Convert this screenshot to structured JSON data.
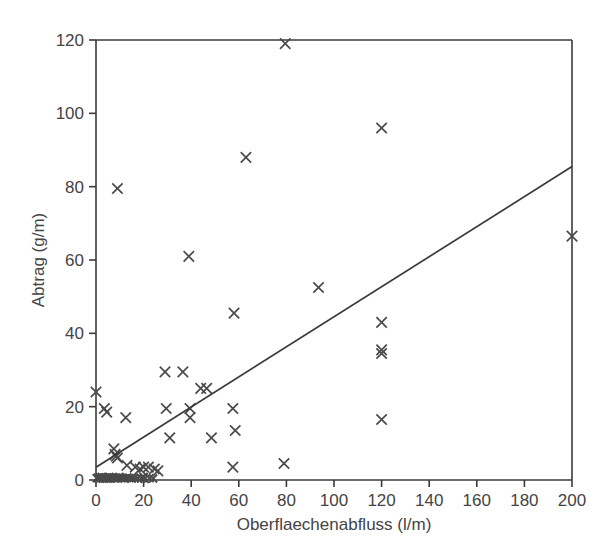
{
  "chart_data": {
    "type": "scatter",
    "title": "",
    "subtitle": "",
    "xlabel": "Oberflaechenabfluss (l/m)",
    "ylabel": "Abtrag (g/m)",
    "xlim": [
      0,
      200
    ],
    "ylim": [
      0,
      120
    ],
    "xticks": [
      0,
      20,
      40,
      60,
      80,
      100,
      120,
      140,
      160,
      180,
      200
    ],
    "yticks": [
      0,
      20,
      40,
      60,
      80,
      100,
      120
    ],
    "xtick_labels": [
      "0",
      "20",
      "40",
      "60",
      "80",
      "100",
      "120",
      "140",
      "160",
      "180",
      "200"
    ],
    "ytick_labels": [
      "0",
      "20",
      "40",
      "60",
      "80",
      "100",
      "120"
    ],
    "grid": false,
    "legend": false,
    "marker": "x",
    "marker_color": "#4a4a4a",
    "axis_color": "#3a3a3a",
    "background": "#ffffff",
    "series": [
      {
        "name": "Messpunkte",
        "marker": "x",
        "points": [
          [
            79.5,
            119.0
          ],
          [
            120.0,
            96.0
          ],
          [
            63.0,
            88.0
          ],
          [
            9.0,
            79.5
          ],
          [
            39.0,
            61.0
          ],
          [
            200.0,
            66.5
          ],
          [
            93.5,
            52.5
          ],
          [
            58.0,
            45.5
          ],
          [
            120.0,
            43.0
          ],
          [
            120.0,
            35.5
          ],
          [
            120.0,
            34.5
          ],
          [
            29.0,
            29.5
          ],
          [
            36.5,
            29.5
          ],
          [
            44.0,
            25.0
          ],
          [
            46.5,
            25.0
          ],
          [
            0.0,
            24.0
          ],
          [
            3.5,
            19.5
          ],
          [
            4.5,
            18.5
          ],
          [
            29.5,
            19.5
          ],
          [
            39.5,
            19.5
          ],
          [
            57.5,
            19.5
          ],
          [
            12.5,
            17.0
          ],
          [
            39.5,
            17.0
          ],
          [
            120.0,
            16.5
          ],
          [
            58.5,
            13.5
          ],
          [
            31.0,
            11.5
          ],
          [
            48.5,
            11.5
          ],
          [
            7.5,
            8.5
          ],
          [
            8.0,
            7.0
          ],
          [
            8.5,
            6.5
          ],
          [
            9.0,
            6.0
          ],
          [
            13.0,
            4.0
          ],
          [
            16.5,
            3.5
          ],
          [
            18.5,
            3.0
          ],
          [
            20.0,
            3.5
          ],
          [
            22.0,
            3.5
          ],
          [
            24.5,
            3.0
          ],
          [
            26.0,
            2.5
          ],
          [
            57.5,
            3.5
          ],
          [
            79.0,
            4.5
          ],
          [
            0.3,
            0.5
          ],
          [
            0.8,
            0.6
          ],
          [
            1.2,
            0.4
          ],
          [
            1.6,
            0.7
          ],
          [
            2.0,
            0.5
          ],
          [
            2.4,
            0.8
          ],
          [
            2.8,
            0.4
          ],
          [
            3.2,
            0.6
          ],
          [
            3.6,
            0.5
          ],
          [
            4.0,
            0.7
          ],
          [
            4.4,
            0.4
          ],
          [
            4.8,
            0.6
          ],
          [
            5.2,
            0.5
          ],
          [
            5.6,
            0.8
          ],
          [
            6.0,
            0.4
          ],
          [
            6.5,
            0.6
          ],
          [
            7.0,
            0.5
          ],
          [
            7.5,
            0.7
          ],
          [
            8.0,
            0.4
          ],
          [
            8.6,
            0.6
          ],
          [
            9.2,
            0.5
          ],
          [
            9.8,
            0.8
          ],
          [
            10.5,
            0.5
          ],
          [
            11.2,
            0.6
          ],
          [
            12.0,
            0.4
          ],
          [
            13.0,
            0.6
          ],
          [
            14.0,
            0.5
          ],
          [
            15.0,
            0.4
          ],
          [
            16.0,
            0.6
          ],
          [
            17.5,
            0.5
          ],
          [
            19.0,
            0.4
          ],
          [
            20.0,
            0.8
          ],
          [
            20.5,
            0.3
          ],
          [
            22.5,
            0.5
          ],
          [
            24.0,
            0.4
          ]
        ]
      }
    ],
    "trendline": {
      "name": "Regressionsgerade",
      "x_start": 0,
      "y_start": 3.5,
      "x_end": 200,
      "y_end": 85.5,
      "color": "#3a3a3a"
    }
  }
}
